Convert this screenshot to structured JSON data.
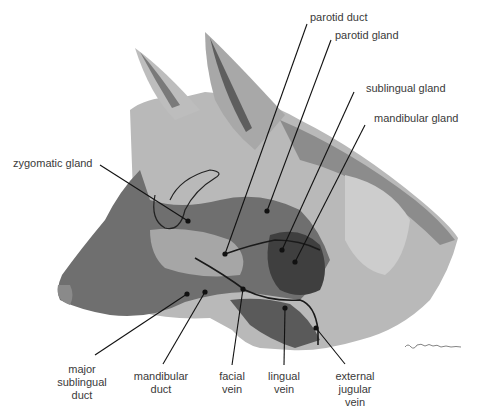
{
  "diagram": {
    "colors": {
      "background": "#ffffff",
      "tone_light": "#c4c4c4",
      "tone_mid": "#9a9a9a",
      "tone_dark": "#6e6e6e",
      "tone_darkest": "#3c3c3c",
      "leader_line": "#111111",
      "label_text": "#3a3a3a"
    },
    "labels": {
      "parotid_duct": "parotid duct",
      "parotid_gland": "parotid gland",
      "sublingual_gland": "sublingual gland",
      "mandibular_gland": "mandibular gland",
      "zygomatic_gland": "zygomatic gland",
      "major_sublingual_duct": "major\nsublingual\nduct",
      "mandibular_duct": "mandibular\nduct",
      "facial_vein": "facial\nvein",
      "lingual_vein": "lingual\nvein",
      "external_jugular_vein": "external\njugular\nvein"
    },
    "signature": "R.Pritchard"
  }
}
